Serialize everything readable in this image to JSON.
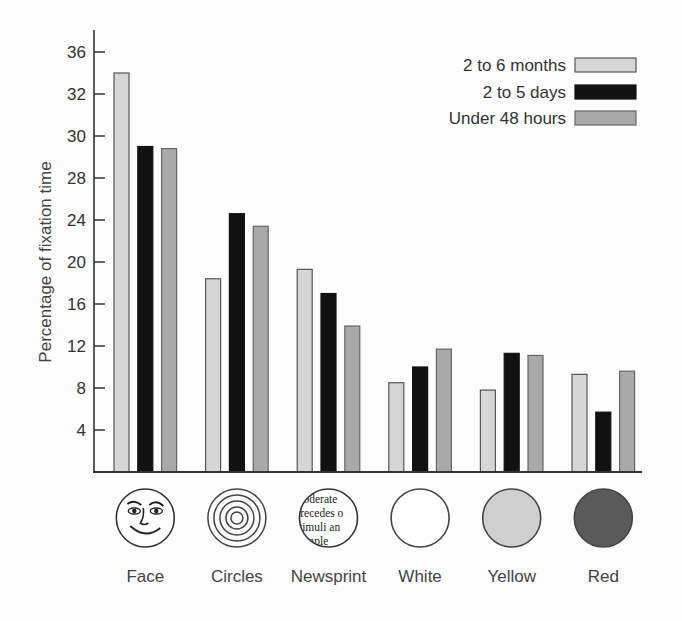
{
  "chart_data": {
    "type": "bar",
    "title": "",
    "xlabel": "",
    "ylabel": "Percentage of fixation time",
    "y_ticks": [
      4,
      8,
      12,
      16,
      20,
      24,
      28,
      30,
      32,
      36
    ],
    "ylim": [
      0,
      38
    ],
    "grid": false,
    "legend_position": "top-right",
    "categories": [
      "Face",
      "Circles",
      "Newsprint",
      "White",
      "Yellow",
      "Red"
    ],
    "category_icons": [
      "face-drawing-icon",
      "concentric-circles-icon",
      "newsprint-circle-icon",
      "white-circle-icon",
      "yellow-circle-icon",
      "red-circle-icon"
    ],
    "category_icon_colors": [
      "#ffffff",
      "#ffffff",
      "#ffffff",
      "#ffffff",
      "#cfcfcf",
      "#5a5a5a"
    ],
    "newsprint_lines": [
      "moderate",
      "precedes o",
      "stimuli an",
      "comple"
    ],
    "series": [
      {
        "name": "2 to 6 months",
        "color": "#d6d6d6",
        "values": [
          34.0,
          18.4,
          19.3,
          8.5,
          7.8,
          9.3
        ]
      },
      {
        "name": "2 to 5 days",
        "color": "#111111",
        "values": [
          29.5,
          24.6,
          17.0,
          10.0,
          11.3,
          5.7
        ]
      },
      {
        "name": "Under 48 hours",
        "color": "#a9a9a9",
        "values": [
          29.4,
          23.4,
          13.9,
          11.7,
          11.1,
          9.6
        ]
      }
    ]
  }
}
